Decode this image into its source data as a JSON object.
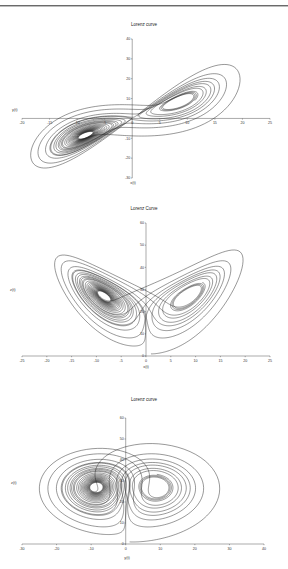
{
  "page": {
    "header_rule": true
  },
  "model": {
    "sigma": 10,
    "rho": 28,
    "beta": 2.6667,
    "x0": 1,
    "y0": 1,
    "z0": 1,
    "dt": 0.005,
    "steps": 5200
  },
  "chart_data": [
    {
      "type": "line",
      "title": "Lorenz curve",
      "xlabel": "x(t)",
      "ylabel": "y(t)",
      "x_var": "x",
      "y_var": "y",
      "xlim": [
        -20,
        25
      ],
      "ylim": [
        -30,
        40
      ],
      "xticks": [
        -20,
        -15,
        -10,
        -5,
        0,
        5,
        10,
        15,
        20,
        25
      ],
      "yticks": [
        -30,
        -20,
        -10,
        0,
        10,
        20,
        30,
        40
      ],
      "grid": false,
      "legend": null,
      "frame": {
        "top": 8,
        "height": 190,
        "x_min_px": 22,
        "x_max_px": 270,
        "y_max_px": 31,
        "y_min_px": 170,
        "axis_x_at": 0,
        "axis_y_at": 0,
        "title_y": 18,
        "ylabel_x": 12,
        "ylabel_y": 103,
        "xlabel_x": 133,
        "xlabel_y": 176,
        "ytick_x": 130
      }
    },
    {
      "type": "line",
      "title": "Lorenz Curve",
      "xlabel": "x(t)",
      "ylabel": "z(t)",
      "x_var": "x",
      "y_var": "z",
      "xlim": [
        -25,
        25
      ],
      "ylim": [
        0,
        60
      ],
      "xticks": [
        -25,
        -20,
        -15,
        -10,
        -5,
        0,
        5,
        10,
        15,
        20,
        25
      ],
      "yticks": [
        0,
        10,
        20,
        30,
        40,
        50,
        60
      ],
      "grid": false,
      "legend": null,
      "frame": {
        "top": 195,
        "height": 185,
        "x_min_px": 22,
        "x_max_px": 270,
        "y_max_px": 28,
        "y_min_px": 161,
        "axis_x_at": 0,
        "axis_y_at": 0,
        "title_y": 15,
        "ylabel_x": 10,
        "ylabel_y": 96,
        "xlabel_x": 146,
        "xlabel_y": 173,
        "ytick_x": 143
      }
    },
    {
      "type": "line",
      "title": "Lorenz curve",
      "xlabel": "y(t)",
      "ylabel": "z(t)",
      "x_var": "y",
      "y_var": "z",
      "xlim": [
        -30,
        40
      ],
      "ylim": [
        0,
        60
      ],
      "xticks": [
        -30,
        -20,
        -10,
        0,
        10,
        20,
        30,
        40
      ],
      "yticks": [
        0,
        10,
        20,
        30,
        40,
        50,
        60
      ],
      "grid": false,
      "legend": null,
      "frame": {
        "top": 385,
        "height": 184,
        "x_min_px": 22,
        "x_max_px": 264,
        "y_max_px": 33,
        "y_min_px": 159,
        "axis_x_at": 0,
        "axis_y_at": 0,
        "title_y": 16,
        "ylabel_x": 11,
        "ylabel_y": 99,
        "xlabel_x": 127,
        "xlabel_y": 174,
        "ytick_x": 124
      }
    }
  ]
}
